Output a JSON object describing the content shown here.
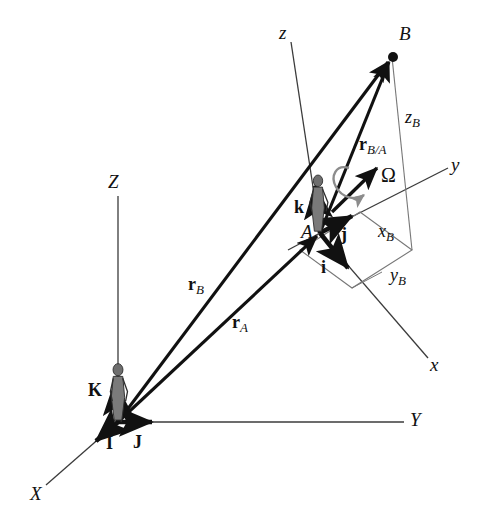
{
  "figure": {
    "background_color": "#ffffff",
    "line_color": "#1a1a1a",
    "thin_line_color": "#555555",
    "spin_arrow_color": "#8c8c8c",
    "figure_fill": "#6e6e6e"
  },
  "labels": {
    "axis_Z": "Z",
    "axis_X": "X",
    "axis_Y": "Y",
    "axis_x": "x",
    "axis_y": "y",
    "axis_z": "z",
    "point_A": "A",
    "point_B": "B",
    "unit_I": "I",
    "unit_J": "J",
    "unit_K": "K",
    "unit_i": "i",
    "unit_j": "j",
    "unit_k": "k",
    "omega": "Ω",
    "r_A_main": "r",
    "r_A_sub": "A",
    "r_B_main": "r",
    "r_B_sub": "B",
    "r_BA_main": "r",
    "r_BA_sub": "B/A",
    "x_B_main": "x",
    "x_B_sub": "B",
    "y_B_main": "y",
    "y_B_sub": "B",
    "z_B_main": "z",
    "z_B_sub": "B"
  },
  "geometry": {
    "origin_O": [
      118,
      422
    ],
    "point_A": [
      320,
      233
    ],
    "point_B": [
      392,
      57
    ],
    "axis_Z_tip": [
      118,
      196
    ],
    "axis_Y_tip": [
      404,
      422
    ],
    "axis_X_tip": [
      46,
      485
    ],
    "axis_x_tip": [
      428,
      358
    ],
    "axis_y_tip": [
      448,
      168
    ],
    "axis_z_tip": [
      291,
      42
    ],
    "parallelogram": [
      [
        360,
        212
      ],
      [
        412,
        250
      ],
      [
        352,
        288
      ],
      [
        300,
        250
      ]
    ],
    "zB_foot": [
      412,
      250
    ]
  }
}
